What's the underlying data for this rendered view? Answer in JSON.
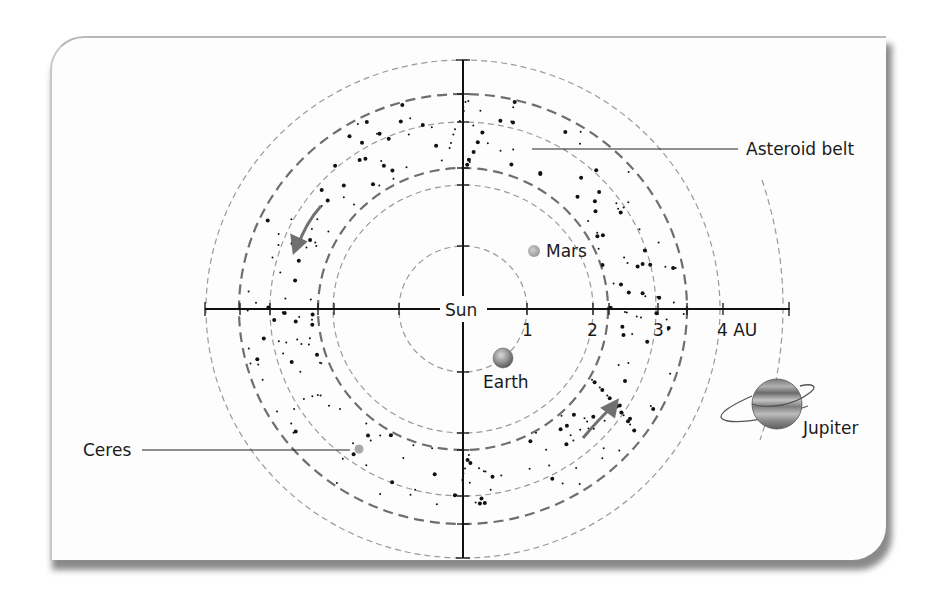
{
  "diagram": {
    "title": "",
    "center_label": "Sun",
    "axis_unit": "AU",
    "axis_ticks": [
      {
        "value": 1,
        "label": "1"
      },
      {
        "value": 2,
        "label": "2"
      },
      {
        "value": 3,
        "label": "3"
      },
      {
        "value": 4,
        "label": "4 AU"
      }
    ],
    "bodies": [
      {
        "name": "Earth",
        "label": "Earth"
      },
      {
        "name": "Mars",
        "label": "Mars"
      },
      {
        "name": "Ceres",
        "label": "Ceres"
      },
      {
        "name": "Jupiter",
        "label": "Jupiter"
      }
    ],
    "regions": [
      {
        "name": "asteroid-belt",
        "label": "Asteroid belt"
      }
    ],
    "colors": {
      "axis": "#111111",
      "orbit": "#9a9a9a",
      "belt_edge": "#6e6e6e",
      "arrow": "#707070",
      "dots": "#111111"
    }
  }
}
